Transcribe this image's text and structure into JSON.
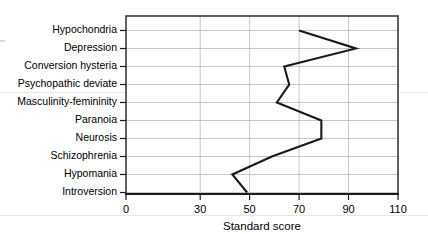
{
  "chart_data": {
    "type": "line",
    "title": "",
    "subtitle": "",
    "orientation": "horizontal",
    "xlabel": "Standard score",
    "ylabel": "",
    "xlim": [
      0,
      110
    ],
    "ylim": [
      0,
      10
    ],
    "grid": true,
    "legend": null,
    "xticks": [
      0,
      30,
      50,
      70,
      90,
      110
    ],
    "xtick_labels": [
      "0",
      "30",
      "50",
      "70",
      "90",
      "110"
    ],
    "categories": [
      "Hypochondria",
      "Depression",
      "Conversion hysteria",
      "Psychopathic deviate",
      "Masculinity-femininity",
      "Paranoia",
      "Neurosis",
      "Schizophrenia",
      "Hypomania",
      "Introversion"
    ],
    "values": [
      70,
      93,
      64,
      66,
      61,
      79,
      79,
      59,
      43,
      49
    ],
    "series": [
      {
        "name": "Standard score",
        "color": "#1a1a1a",
        "values": [
          70,
          93,
          64,
          66,
          61,
          79,
          79,
          59,
          43,
          49
        ]
      }
    ],
    "colors": {
      "line": "#1a1a1a",
      "grid": "#b9b9b9",
      "frame": "#3a3a3a",
      "axis": "#1c1c1c",
      "background": "#ffffff",
      "page_rule": "#e8e8e8"
    }
  }
}
